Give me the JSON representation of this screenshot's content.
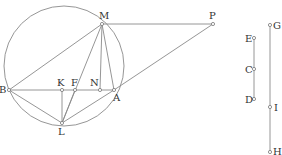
{
  "diagram": {
    "type": "geometry-figure",
    "circle": {
      "cx": 64,
      "cy": 66,
      "r": 60
    },
    "points": [
      {
        "id": "M",
        "label": "M",
        "x": 102,
        "y": 24,
        "lx": 99,
        "ly": 19
      },
      {
        "id": "P",
        "label": "P",
        "x": 213,
        "y": 24,
        "lx": 209,
        "ly": 19
      },
      {
        "id": "B",
        "label": "B",
        "x": 9,
        "y": 90,
        "lx": -1,
        "ly": 93
      },
      {
        "id": "K",
        "label": "K",
        "x": 62,
        "y": 90,
        "lx": 57,
        "ly": 86
      },
      {
        "id": "F",
        "label": "F",
        "x": 75,
        "y": 90,
        "lx": 71,
        "ly": 86
      },
      {
        "id": "N",
        "label": "N",
        "x": 100,
        "y": 90,
        "lx": 90,
        "ly": 86
      },
      {
        "id": "A",
        "label": "A",
        "x": 114,
        "y": 90,
        "lx": 113,
        "ly": 101
      },
      {
        "id": "L",
        "label": "L",
        "x": 62,
        "y": 123,
        "lx": 58,
        "ly": 135
      },
      {
        "id": "E",
        "label": "E",
        "x": 254,
        "y": 38,
        "lx": 245,
        "ly": 42
      },
      {
        "id": "C",
        "label": "C",
        "x": 254,
        "y": 69,
        "lx": 245,
        "ly": 73
      },
      {
        "id": "D",
        "label": "D",
        "x": 254,
        "y": 99,
        "lx": 245,
        "ly": 103
      },
      {
        "id": "G",
        "label": "G",
        "x": 270,
        "y": 25,
        "lx": 273,
        "ly": 29
      },
      {
        "id": "I",
        "label": "I",
        "x": 270,
        "y": 107,
        "lx": 274,
        "ly": 111
      },
      {
        "id": "H",
        "label": "H",
        "x": 270,
        "y": 152,
        "lx": 273,
        "ly": 155
      }
    ],
    "segments": [
      [
        "M",
        "P"
      ],
      [
        "B",
        "M"
      ],
      [
        "B",
        "A"
      ],
      [
        "M",
        "L"
      ],
      [
        "M",
        "N"
      ],
      [
        "M",
        "A"
      ],
      [
        "K",
        "L"
      ],
      [
        "B",
        "L"
      ],
      [
        "L",
        "A"
      ],
      [
        "A",
        "P"
      ],
      [
        "F",
        "L"
      ],
      [
        "E",
        "D"
      ],
      [
        "G",
        "H"
      ]
    ]
  }
}
